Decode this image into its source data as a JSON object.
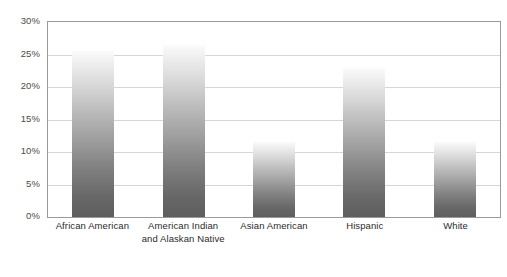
{
  "chart_data": {
    "type": "bar",
    "title": "",
    "subtitle": "",
    "xlabel": "",
    "ylabel": "",
    "categories": [
      "African American",
      "American Indian and Alaskan Native",
      "Asian American",
      "Hispanic",
      "White"
    ],
    "values": [
      25.6,
      26.5,
      11.5,
      22.9,
      11.5
    ],
    "ylim": [
      0,
      30
    ],
    "y_ticks": [
      0,
      5,
      10,
      15,
      20,
      25,
      30
    ],
    "y_tick_labels": [
      "0%",
      "5%",
      "10%",
      "15%",
      "20%",
      "25%",
      "30%"
    ],
    "grid": true,
    "legend": null,
    "value_suffix": "%"
  },
  "axis": {
    "y_labels": [
      "30%",
      "25%",
      "20%",
      "15%",
      "10%",
      "5%",
      "0%"
    ],
    "x_labels": [
      "African American",
      "American Indian and Alaskan Native",
      "Asian American",
      "Hispanic",
      "White"
    ]
  },
  "colors": {
    "bar_top": "#fbfbfb",
    "bar_bottom": "#5e5e5e",
    "gridline": "#d6d6d6",
    "plot_border": "#9a9a9a",
    "axis_text": "#4b4b4b",
    "category_text": "#2b2b2b",
    "background": "#ffffff"
  }
}
